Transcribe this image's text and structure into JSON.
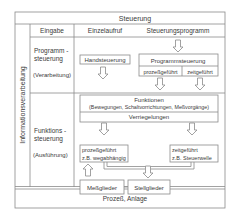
{
  "title": "Steuerung",
  "side_label": "Informationsverarbeitung",
  "header": {
    "col1": "Eingabe",
    "col2": "Einzelaufruf",
    "col3": "Steuerungsprogramm"
  },
  "rows": [
    {
      "line1": "Programm -",
      "line2": "steuerung",
      "line3": "(Verarbeitung)"
    },
    {
      "line1": "Funktions -",
      "line2": "steuerung",
      "line3": "(Ausführung)"
    }
  ],
  "boxes": {
    "handsteuerung": "Handsteuerung",
    "programmsteuerung": "Programmsteuerung",
    "prozessgefuehrt_small": "prozeßgeführt",
    "zeitgefuehrt_small": "zeitgeführt",
    "funktionen": "Funktionen",
    "funktionen_detail": "(Bewegungen, Schaltvorrichtungen, Meßvorgänge)",
    "verriegelungen": "Verriegelungen",
    "prozess_line1": "prozeßgeführt",
    "prozess_line2": "z.B. wegabhängig",
    "zeit_line1": "zeitgeführt",
    "zeit_line2": "z.B. Steuerwelle",
    "messglieder": "Meßglieder",
    "stellglieder": "Stellglieder"
  },
  "footer": "Prozeß, Anlage",
  "colors": {
    "line": "#8a8a8a",
    "text": "#3a3a3a"
  }
}
